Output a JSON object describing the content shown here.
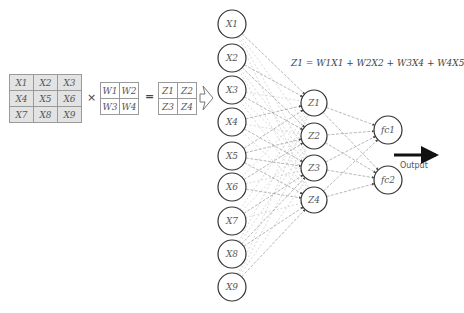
{
  "input_matrix": {
    "rows": [
      [
        "X1",
        "X2",
        "X3"
      ],
      [
        "X4",
        "X5",
        "X6"
      ],
      [
        "X7",
        "X8",
        "X9"
      ]
    ]
  },
  "operator_multiply": "×",
  "kernel_matrix": {
    "rows": [
      [
        "W1",
        "W2"
      ],
      [
        "W3",
        "W4"
      ]
    ]
  },
  "operator_equals": "=",
  "result_matrix": {
    "rows": [
      [
        "Z1",
        "Z2"
      ],
      [
        "Z3",
        "Z4"
      ]
    ]
  },
  "transition_arrow": "hollow-right-arrow",
  "equation": "Z1 = W1X1 + W2X2 + W3X4 + W4X5",
  "input_layer": {
    "nodes": [
      "X1",
      "X2",
      "X3",
      "X4",
      "X5",
      "X6",
      "X7",
      "X8",
      "X9"
    ]
  },
  "hidden_layer": {
    "nodes": [
      "Z1",
      "Z2",
      "Z3",
      "Z4"
    ],
    "connections": {
      "Z1": [
        "X1",
        "X2",
        "X4",
        "X5"
      ],
      "Z2": [
        "X2",
        "X3",
        "X5",
        "X6"
      ],
      "Z3": [
        "X4",
        "X5",
        "X7",
        "X8"
      ],
      "Z4": [
        "X5",
        "X6",
        "X8",
        "X9"
      ]
    }
  },
  "output_layer": {
    "nodes": [
      "fc1",
      "fc2"
    ]
  },
  "output_arrow_label": "Output",
  "colors": {
    "node_stroke": "#333333",
    "edge": "#9a9a9a",
    "edge_light": "#c8c8c8",
    "matrix_fill": "#e3e3e3",
    "arrow": "#111111"
  }
}
